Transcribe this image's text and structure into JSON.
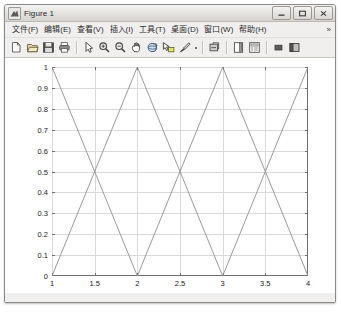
{
  "window": {
    "title": "Figure 1",
    "icon": "matlab-figure-icon",
    "buttons": [
      {
        "name": "minimize-button",
        "label": "–"
      },
      {
        "name": "maximize-button",
        "label": "☐"
      },
      {
        "name": "close-button",
        "label": "✕"
      }
    ]
  },
  "menu": {
    "items": [
      {
        "name": "menu-file",
        "label": "文件(F)"
      },
      {
        "name": "menu-edit",
        "label": "编辑(E)"
      },
      {
        "name": "menu-view",
        "label": "查看(V)"
      },
      {
        "name": "menu-insert",
        "label": "插入(I)"
      },
      {
        "name": "menu-tools",
        "label": "工具(T)"
      },
      {
        "name": "menu-desktop",
        "label": "桌面(D)"
      },
      {
        "name": "menu-window",
        "label": "窗口(W)"
      },
      {
        "name": "menu-help",
        "label": "帮助(H)"
      }
    ],
    "overflow_label": "»"
  },
  "toolbar": {
    "buttons": [
      {
        "name": "new-figure-icon",
        "label": "New Figure"
      },
      {
        "name": "open-file-icon",
        "label": "Open File"
      },
      {
        "name": "save-figure-icon",
        "label": "Save Figure"
      },
      {
        "name": "print-figure-icon",
        "label": "Print Figure"
      },
      {
        "name": "edit-plot-icon",
        "label": "Edit Plot"
      },
      {
        "name": "zoom-in-icon",
        "label": "Zoom In"
      },
      {
        "name": "zoom-out-icon",
        "label": "Zoom Out"
      },
      {
        "name": "pan-icon",
        "label": "Pan"
      },
      {
        "name": "rotate-3d-icon",
        "label": "Rotate 3D"
      },
      {
        "name": "data-cursor-icon",
        "label": "Data Cursor"
      },
      {
        "name": "brush-icon",
        "label": "Brush/Select Data"
      },
      {
        "name": "link-plot-icon",
        "label": "Link Plot"
      },
      {
        "name": "colorbar-icon",
        "label": "Insert Colorbar"
      },
      {
        "name": "legend-icon",
        "label": "Insert Legend"
      },
      {
        "name": "hide-plot-tools-icon",
        "label": "Hide Plot Tools"
      },
      {
        "name": "show-plot-tools-icon",
        "label": "Show Plot Tools"
      }
    ]
  },
  "chart_data": {
    "type": "line",
    "title": "",
    "xlabel": "",
    "ylabel": "",
    "xlim": [
      1,
      4
    ],
    "ylim": [
      0,
      1
    ],
    "grid": true,
    "legend": null,
    "xticks": [
      "1",
      "1.5",
      "2",
      "2.5",
      "3",
      "3.5",
      "4"
    ],
    "xtick_values": [
      1,
      1.5,
      2,
      2.5,
      3,
      3.5,
      4
    ],
    "yticks": [
      "0",
      "0.1",
      "0.2",
      "0.3",
      "0.4",
      "0.5",
      "0.6",
      "0.7",
      "0.8",
      "0.9",
      "1"
    ],
    "ytick_values": [
      0,
      0.1,
      0.2,
      0.3,
      0.4,
      0.5,
      0.6,
      0.7,
      0.8,
      0.9,
      1
    ],
    "line_color": "#8f8f8f",
    "grid_color": "#d9d9d9",
    "axis_color": "#6e6e6e",
    "series": [
      {
        "name": "descending-triangle-wave",
        "color": "#8f8f8f",
        "x": [
          1,
          2,
          3,
          4
        ],
        "y": [
          1,
          0,
          1,
          0
        ]
      },
      {
        "name": "ascending-triangle-wave",
        "color": "#8f8f8f",
        "x": [
          1,
          2,
          3,
          4
        ],
        "y": [
          0,
          1,
          0,
          1
        ]
      }
    ]
  }
}
